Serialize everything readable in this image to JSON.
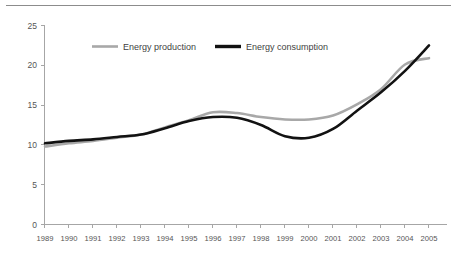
{
  "chart_data": {
    "type": "line",
    "title": "",
    "subtitle": "",
    "xlabel": "",
    "ylabel": "",
    "categories": [
      "1989",
      "1990",
      "1991",
      "1992",
      "1993",
      "1994",
      "1995",
      "1996",
      "1997",
      "1998",
      "1999",
      "2000",
      "2001",
      "2002",
      "2003",
      "2004",
      "2005"
    ],
    "x": [
      1989,
      1990,
      1991,
      1992,
      1993,
      1994,
      1995,
      1996,
      1997,
      1998,
      1999,
      2000,
      2001,
      2002,
      2003,
      2004,
      2005
    ],
    "series": [
      {
        "name": "Energy production",
        "color": "#a8a8a8",
        "values": [
          9.8,
          10.2,
          10.5,
          10.9,
          11.3,
          12.2,
          13.1,
          14.1,
          14.0,
          13.5,
          13.2,
          13.2,
          13.7,
          15.1,
          17.0,
          20.1,
          20.9
        ]
      },
      {
        "name": "Energy consumption",
        "color": "#121212",
        "values": [
          10.2,
          10.5,
          10.7,
          11.0,
          11.3,
          12.1,
          13.0,
          13.5,
          13.4,
          12.5,
          11.1,
          10.9,
          12.0,
          14.3,
          16.6,
          19.3,
          22.5
        ]
      }
    ],
    "ylim": [
      0,
      25
    ],
    "yticks": [
      0,
      5,
      10,
      15,
      20,
      25
    ],
    "ytick_labels": [
      "0",
      "5",
      "10",
      "15",
      "20",
      "25"
    ],
    "grid": false,
    "legend_position": "top-center",
    "smoothing": true
  },
  "legend": {
    "items": [
      {
        "label": "Energy production",
        "swatch_color": "#a8a8a8"
      },
      {
        "label": "Energy consumption",
        "swatch_color": "#121212"
      }
    ]
  },
  "axes": {
    "y_tick_labels": [
      "25",
      "20",
      "15",
      "10",
      "5",
      "0"
    ],
    "x_tick_labels": [
      "1989",
      "1990",
      "1991",
      "1992",
      "1993",
      "1994",
      "1995",
      "1996",
      "1997",
      "1998",
      "1999",
      "2000",
      "2001",
      "2002",
      "2003",
      "2004",
      "2005"
    ]
  },
  "colors": {
    "production_line": "#a8a8a8",
    "consumption_line": "#121212",
    "axis": "#a6a6a6",
    "tick_text": "#555555",
    "top_rule": "#8c8c8c",
    "background": "#ffffff"
  }
}
